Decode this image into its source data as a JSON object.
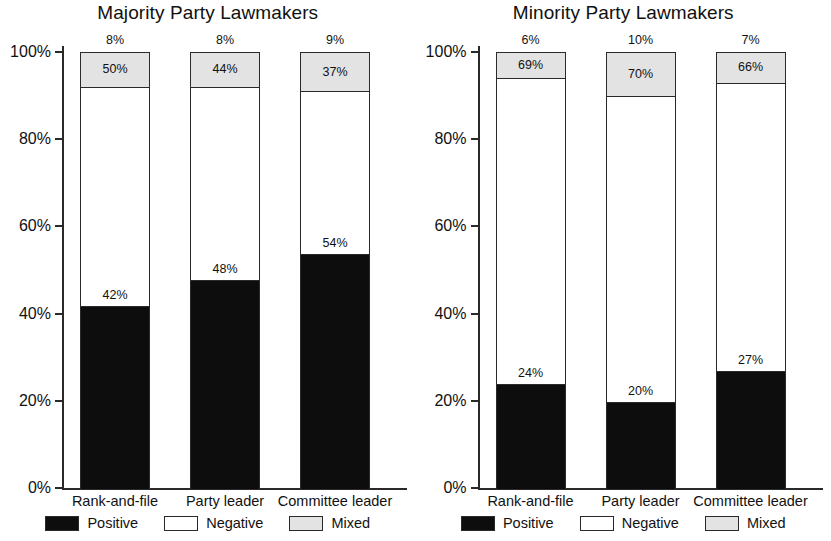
{
  "chart_data": [
    {
      "type": "bar",
      "title": "Majority Party Lawmakers",
      "xlabel": "",
      "ylabel": "",
      "ylim": [
        0,
        100
      ],
      "yticks": [
        "0%",
        "20%",
        "40%",
        "60%",
        "80%",
        "100%"
      ],
      "grid": false,
      "legend_position": "bottom",
      "stacked": true,
      "categories": [
        "Rank-and-file",
        "Party leader",
        "Committee leader"
      ],
      "series": [
        {
          "name": "Positive",
          "color": "#0d0d0d",
          "values": [
            42,
            48,
            54
          ],
          "labels": [
            "42%",
            "48%",
            "54%"
          ]
        },
        {
          "name": "Negative",
          "color": "#ffffff",
          "values": [
            50,
            44,
            37
          ],
          "labels": [
            "50%",
            "44%",
            "37%"
          ]
        },
        {
          "name": "Mixed",
          "color": "#e3e3e3",
          "values": [
            8,
            8,
            9
          ],
          "labels": [
            "8%",
            "8%",
            "9%"
          ]
        }
      ],
      "legend": [
        "Positive",
        "Negative",
        "Mixed"
      ]
    },
    {
      "type": "bar",
      "title": "Minority Party Lawmakers",
      "xlabel": "",
      "ylabel": "",
      "ylim": [
        0,
        100
      ],
      "yticks": [
        "0%",
        "20%",
        "40%",
        "60%",
        "80%",
        "100%"
      ],
      "grid": false,
      "legend_position": "bottom",
      "stacked": true,
      "categories": [
        "Rank-and-file",
        "Party leader",
        "Committee leader"
      ],
      "series": [
        {
          "name": "Positive",
          "color": "#0d0d0d",
          "values": [
            24,
            20,
            27
          ],
          "labels": [
            "24%",
            "20%",
            "27%"
          ]
        },
        {
          "name": "Negative",
          "color": "#ffffff",
          "values": [
            69,
            70,
            66
          ],
          "labels": [
            "69%",
            "70%",
            "66%"
          ]
        },
        {
          "name": "Mixed",
          "color": "#e3e3e3",
          "values": [
            6,
            10,
            7
          ],
          "labels": [
            "6%",
            "10%",
            "7%"
          ]
        }
      ],
      "legend": [
        "Positive",
        "Negative",
        "Mixed"
      ]
    }
  ],
  "panels": [
    {
      "title": "Majority Party Lawmakers",
      "yticks": [
        "100%",
        "80%",
        "60%",
        "40%",
        "20%",
        "0%"
      ],
      "bars": [
        {
          "category": "Rank-and-file",
          "positive": 42,
          "negative": 50,
          "mixed": 8,
          "positive_label": "42%",
          "mixed_inside_label": "50%",
          "top_label": "8%"
        },
        {
          "category": "Party leader",
          "positive": 48,
          "negative": 44,
          "mixed": 8,
          "positive_label": "48%",
          "mixed_inside_label": "44%",
          "top_label": "8%"
        },
        {
          "category": "Committee leader",
          "positive": 54,
          "negative": 37,
          "mixed": 9,
          "positive_label": "54%",
          "mixed_inside_label": "37%",
          "top_label": "9%"
        }
      ],
      "legend": [
        {
          "name": "Positive",
          "swatch": "positive"
        },
        {
          "name": "Negative",
          "swatch": "negative"
        },
        {
          "name": "Mixed",
          "swatch": "mixed"
        }
      ]
    },
    {
      "title": "Minority Party Lawmakers",
      "yticks": [
        "100%",
        "80%",
        "60%",
        "40%",
        "20%",
        "0%"
      ],
      "bars": [
        {
          "category": "Rank-and-file",
          "positive": 24,
          "negative": 69,
          "mixed": 6,
          "positive_label": "24%",
          "mixed_inside_label": "69%",
          "top_label": "6%"
        },
        {
          "category": "Party leader",
          "positive": 20,
          "negative": 70,
          "mixed": 10,
          "positive_label": "20%",
          "mixed_inside_label": "70%",
          "top_label": "10%"
        },
        {
          "category": "Committee leader",
          "positive": 27,
          "negative": 66,
          "mixed": 7,
          "positive_label": "27%",
          "mixed_inside_label": "66%",
          "top_label": "7%"
        }
      ],
      "legend": [
        {
          "name": "Positive",
          "swatch": "positive"
        },
        {
          "name": "Negative",
          "swatch": "negative"
        },
        {
          "name": "Mixed",
          "swatch": "mixed"
        }
      ]
    }
  ],
  "colors": {
    "positive": "#0d0d0d",
    "negative": "#ffffff",
    "mixed": "#e3e3e3",
    "axis": "#2a2a2a",
    "text": "#111111",
    "background": "#ffffff"
  }
}
